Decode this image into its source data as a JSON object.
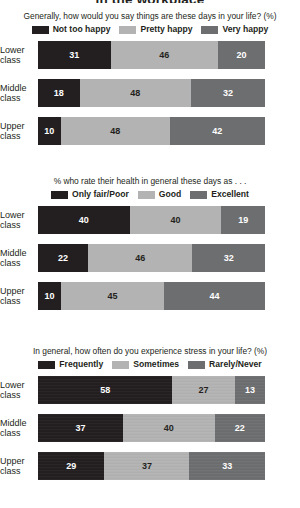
{
  "page": {
    "title": "in the workplace",
    "background": "#ffffff",
    "text_color": "#231f20"
  },
  "colors": {
    "dark": "#231f20",
    "light": "#b3b3b3",
    "medium": "#6d6e70",
    "label_text": "#231f20",
    "value_text_on_dark": "#ffffff",
    "value_text_on_light": "#231f20"
  },
  "chart_data": [
    {
      "type": "bar",
      "orientation": "horizontal",
      "stacked": true,
      "normalized_percent": true,
      "title": "Generally, how would you say things are these days in your life? (%)",
      "xlabel": "",
      "ylabel": "",
      "xlim": [
        0,
        100
      ],
      "grid": false,
      "legend_position": "top-center",
      "categories": [
        "Lower class",
        "Middle class",
        "Upper class"
      ],
      "category_lines": [
        [
          "Lower",
          "class"
        ],
        [
          "Middle",
          "class"
        ],
        [
          "Upper",
          "class"
        ]
      ],
      "series": [
        {
          "name": "Not too happy",
          "color": "#231f20",
          "values": [
            31,
            18,
            10
          ]
        },
        {
          "name": "Pretty happy",
          "color": "#b3b3b3",
          "values": [
            46,
            48,
            48
          ]
        },
        {
          "name": "Very happy",
          "color": "#6d6e70",
          "values": [
            20,
            32,
            42
          ]
        }
      ]
    },
    {
      "type": "bar",
      "orientation": "horizontal",
      "stacked": true,
      "normalized_percent": true,
      "title": "% who rate their health in general these days as . . .",
      "xlabel": "",
      "ylabel": "",
      "xlim": [
        0,
        100
      ],
      "grid": false,
      "legend_position": "top-center",
      "categories": [
        "Lower class",
        "Middle class",
        "Upper class"
      ],
      "category_lines": [
        [
          "Lower",
          "class"
        ],
        [
          "Middle",
          "class"
        ],
        [
          "Upper",
          "class"
        ]
      ],
      "series": [
        {
          "name": "Only fair/Poor",
          "color": "#231f20",
          "values": [
            40,
            22,
            10
          ]
        },
        {
          "name": "Good",
          "color": "#b3b3b3",
          "values": [
            40,
            46,
            45
          ]
        },
        {
          "name": "Excellent",
          "color": "#6d6e70",
          "values": [
            19,
            32,
            44
          ]
        }
      ]
    },
    {
      "type": "bar",
      "orientation": "horizontal",
      "stacked": true,
      "normalized_percent": true,
      "title": "In general, how often do you experience stress in your life? (%)",
      "xlabel": "",
      "ylabel": "",
      "xlim": [
        0,
        100
      ],
      "grid": false,
      "legend_position": "top-center",
      "categories": [
        "Lower class",
        "Middle class",
        "Upper class"
      ],
      "category_lines": [
        [
          "Lower",
          "class"
        ],
        [
          "Middle",
          "class"
        ],
        [
          "Upper",
          "class"
        ]
      ],
      "series": [
        {
          "name": "Frequently",
          "color": "#231f20",
          "values": [
            58,
            37,
            29
          ]
        },
        {
          "name": "Sometimes",
          "color": "#b3b3b3",
          "values": [
            27,
            40,
            37
          ]
        },
        {
          "name": "Rarely/Never",
          "color": "#6d6e70",
          "values": [
            13,
            22,
            33
          ]
        }
      ]
    }
  ]
}
